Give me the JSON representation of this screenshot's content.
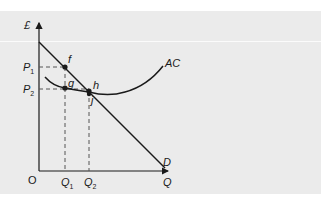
{
  "diagram": {
    "type": "economics-monopoly-cost-demand",
    "axes": {
      "y_label": "£",
      "x_label": "Q",
      "origin_label": "O"
    },
    "price_labels": [
      {
        "base": "P",
        "sub": "1"
      },
      {
        "base": "P",
        "sub": "2"
      }
    ],
    "quantity_labels": [
      {
        "base": "Q",
        "sub": "1"
      },
      {
        "base": "Q",
        "sub": "2"
      }
    ],
    "curves": [
      {
        "name": "D",
        "label": "D",
        "kind": "demand"
      },
      {
        "name": "AC",
        "label": "AC",
        "kind": "average-cost"
      }
    ],
    "points": [
      {
        "label": "f",
        "on": "D",
        "at": "Q1,P1"
      },
      {
        "label": "g",
        "on": "AC",
        "at": "Q1,P2"
      },
      {
        "label": "h",
        "on": "D∩AC"
      },
      {
        "label": "j",
        "on": "AC",
        "at": "Q2"
      }
    ],
    "colors": {
      "background": "#ebebeb",
      "line": "#1a1a1a",
      "dash": "#555555"
    }
  }
}
